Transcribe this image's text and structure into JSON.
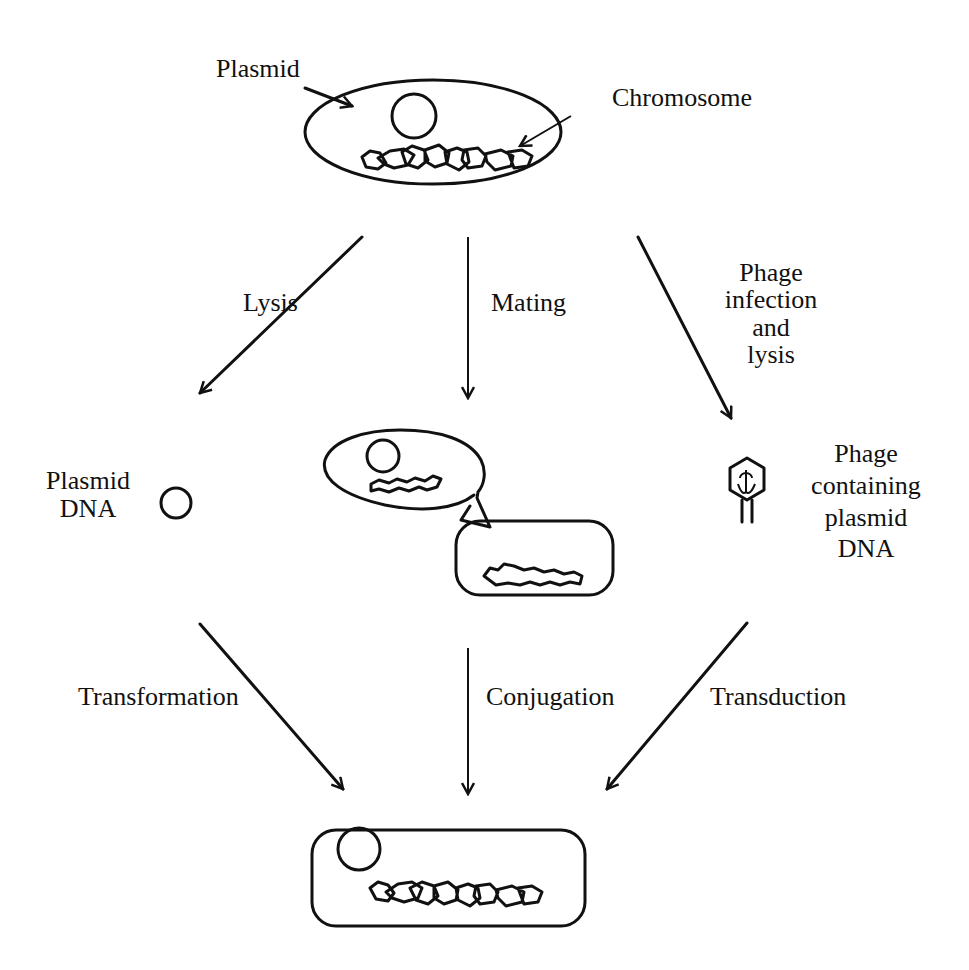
{
  "diagram": {
    "colors": {
      "ink": "#111111",
      "background": "#ffffff"
    },
    "top_cell": {
      "labels": {
        "plasmid": "Plasmid",
        "chromosome": "Chromosome"
      }
    },
    "pathways": [
      {
        "id": "left",
        "step1_label": "Lysis",
        "intermediate_label_lines": [
          "Plasmid",
          "DNA"
        ],
        "step2_label": "Transformation"
      },
      {
        "id": "middle",
        "step1_label": "Mating",
        "intermediate_label_lines": [],
        "step2_label": "Conjugation"
      },
      {
        "id": "right",
        "step1_label_lines": [
          "Phage",
          "infection",
          "and",
          "lysis"
        ],
        "intermediate_label_lines": [
          "Phage",
          "containing",
          "plasmid",
          "DNA"
        ],
        "step2_label": "Transduction"
      }
    ],
    "bottom_cell": {
      "description": "Recipient cell containing plasmid and chromosome"
    }
  }
}
